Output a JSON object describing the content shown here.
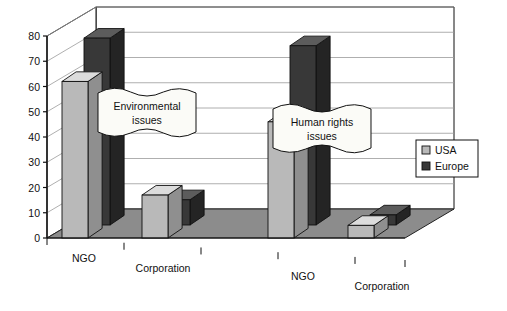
{
  "chart_data": {
    "type": "bar",
    "title": "",
    "xlabel": "",
    "ylabel": "",
    "ylim": [
      0,
      80
    ],
    "ytick_values": [
      0,
      10,
      20,
      30,
      40,
      50,
      60,
      70,
      80
    ],
    "ytick_labels": [
      "0",
      "10",
      "20",
      "30",
      "40",
      "50",
      "60",
      "70",
      "80"
    ],
    "grid": true,
    "projection": "3d-perspective",
    "legend_position": "right",
    "categories": [
      "NGO",
      "Corporation",
      "NGO",
      "Corporation"
    ],
    "series": [
      {
        "name": "USA",
        "color": "#b9b9b9",
        "values": [
          62,
          17,
          46,
          5
        ]
      },
      {
        "name": "Europe",
        "color": "#383838",
        "values": [
          74,
          10,
          71,
          4
        ]
      }
    ],
    "annotations": [
      {
        "name": "environmental-issues-banner",
        "line1": "Environmental",
        "line2": "issues"
      },
      {
        "name": "human-rights-banner",
        "line1": "Human rights",
        "line2": "issues"
      }
    ]
  },
  "legend": {
    "items": [
      {
        "label": "USA",
        "swatch_color": "#b9b9b9"
      },
      {
        "label": "Europe",
        "swatch_color": "#383838"
      }
    ]
  },
  "colors": {
    "floor": "#8c8c8c",
    "floor_edge": "#222222",
    "wall": "#ffffff",
    "gridline": "#9a9a9a",
    "axis": "#111111",
    "usa_front": "#b9b9b9",
    "usa_top": "#dcdcdc",
    "usa_side": "#8f8f8f",
    "europe_front": "#383838",
    "europe_top": "#5c5c5c",
    "europe_side": "#242424",
    "banner_fill": "#fbfbf7"
  }
}
